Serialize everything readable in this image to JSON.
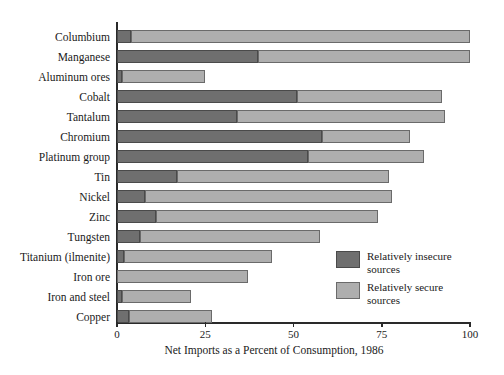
{
  "chart_data": {
    "type": "bar",
    "orientation": "horizontal",
    "stacked": true,
    "title": "",
    "xlabel": "Net Imports as a Percent of Consumption, 1986",
    "ylabel": "",
    "xlim": [
      0,
      100
    ],
    "xticks": [
      0,
      25,
      50,
      75,
      100
    ],
    "xtick_labels": [
      "0",
      "25",
      "50",
      "75",
      "100"
    ],
    "grid": false,
    "legend_position": "inside-right-lower",
    "categories": [
      "Columbium",
      "Manganese",
      "Aluminum ores",
      "Cobalt",
      "Tantalum",
      "Chromium",
      "Platinum group",
      "Tin",
      "Nickel",
      "Zinc",
      "Tungsten",
      "Titanium (ilmenite)",
      "Iron ore",
      "Iron and steel",
      "Copper"
    ],
    "series": [
      {
        "name": "Relatively insecure sources",
        "color": "#6f6f6f",
        "values": [
          4,
          40,
          1.5,
          51,
          34,
          58,
          54,
          17,
          8,
          11,
          6.5,
          2,
          0,
          1.5,
          3.5
        ]
      },
      {
        "name": "Relatively secure sources",
        "color": "#aeaeae",
        "values": [
          96,
          60,
          23.5,
          41,
          59,
          25,
          33,
          60,
          70,
          63,
          51,
          42,
          37,
          19.5,
          23.5
        ]
      }
    ],
    "totals": [
      100,
      100,
      25,
      92,
      93,
      83,
      87,
      77,
      78,
      74,
      57.5,
      44,
      37,
      21,
      27
    ]
  },
  "legend": {
    "items": [
      {
        "label_line1": "Relatively insecure",
        "label_line2": "sources",
        "swatch": "insecure"
      },
      {
        "label_line1": "Relatively secure",
        "label_line2": "sources",
        "swatch": "secure"
      }
    ]
  },
  "colors": {
    "insecure": "#6f6f6f",
    "secure": "#aeaeae",
    "axis": "#2a2a2a",
    "background": "#ffffff"
  }
}
